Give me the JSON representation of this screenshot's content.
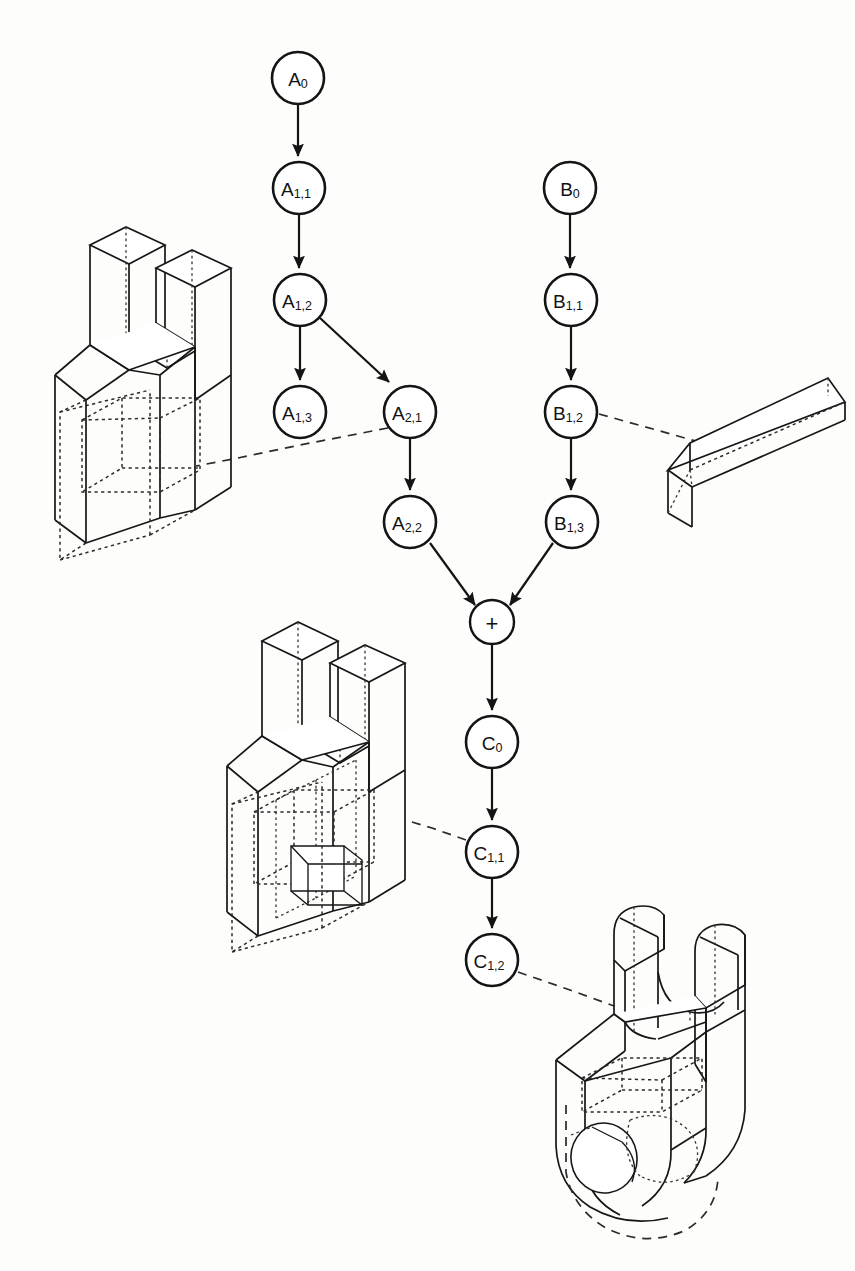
{
  "figure": {
    "kind": "csg-construction-tree",
    "background_color": "#fdfdfc",
    "ink_color": "#141414",
    "width": 855,
    "height": 1271
  },
  "graph": {
    "operator_node": {
      "id": "plus",
      "label": "+",
      "cx": 492,
      "cy": 622,
      "r": 22
    },
    "branches": [
      {
        "name": "A",
        "nodes": [
          {
            "id": "A0",
            "base": "A",
            "sub": "0",
            "cx": 298,
            "cy": 78,
            "r": 26
          },
          {
            "id": "A11",
            "base": "A",
            "sub": "1,1",
            "cx": 299,
            "cy": 188,
            "r": 26
          },
          {
            "id": "A12",
            "base": "A",
            "sub": "1,2",
            "cx": 300,
            "cy": 300,
            "r": 26
          },
          {
            "id": "A13",
            "base": "A",
            "sub": "1,3",
            "cx": 300,
            "cy": 412,
            "r": 26
          },
          {
            "id": "A21",
            "base": "A",
            "sub": "2,1",
            "cx": 410,
            "cy": 412,
            "r": 26
          },
          {
            "id": "A22",
            "base": "A",
            "sub": "2,2",
            "cx": 410,
            "cy": 522,
            "r": 26
          }
        ]
      },
      {
        "name": "B",
        "nodes": [
          {
            "id": "B0",
            "base": "B",
            "sub": "0",
            "cx": 570,
            "cy": 188,
            "r": 26
          },
          {
            "id": "B11",
            "base": "B",
            "sub": "1,1",
            "cx": 571,
            "cy": 300,
            "r": 26
          },
          {
            "id": "B12",
            "base": "B",
            "sub": "1,2",
            "cx": 571,
            "cy": 412,
            "r": 26
          },
          {
            "id": "B13",
            "base": "B",
            "sub": "1,3",
            "cx": 572,
            "cy": 522,
            "r": 26
          }
        ]
      },
      {
        "name": "C",
        "nodes": [
          {
            "id": "C0",
            "base": "C",
            "sub": "0",
            "cx": 492,
            "cy": 742,
            "r": 26
          },
          {
            "id": "C11",
            "base": "C",
            "sub": "1,1",
            "cx": 492,
            "cy": 852,
            "r": 26
          },
          {
            "id": "C12",
            "base": "C",
            "sub": "1,2",
            "cx": 492,
            "cy": 960,
            "r": 26
          }
        ]
      }
    ],
    "edges": [
      {
        "from": "A0",
        "to": "A11",
        "kind": "arrow"
      },
      {
        "from": "A11",
        "to": "A12",
        "kind": "arrow"
      },
      {
        "from": "A12",
        "to": "A13",
        "kind": "arrow"
      },
      {
        "from": "A12",
        "to": "A21",
        "kind": "arrow"
      },
      {
        "from": "A21",
        "to": "A22",
        "kind": "arrow"
      },
      {
        "from": "A22",
        "to": "plus",
        "kind": "arrow"
      },
      {
        "from": "B0",
        "to": "B11",
        "kind": "arrow"
      },
      {
        "from": "B11",
        "to": "B12",
        "kind": "arrow"
      },
      {
        "from": "B12",
        "to": "B13",
        "kind": "arrow"
      },
      {
        "from": "B13",
        "to": "plus",
        "kind": "arrow"
      },
      {
        "from": "plus",
        "to": "C0",
        "kind": "arrow"
      },
      {
        "from": "C0",
        "to": "C11",
        "kind": "arrow"
      },
      {
        "from": "C11",
        "to": "C12",
        "kind": "arrow"
      }
    ],
    "leaders": [
      {
        "id": "leader-a21",
        "from_node": "A21",
        "to_part": "part-u-bracket",
        "points": "388,428 300,445 238,458 196,466"
      },
      {
        "id": "leader-b12",
        "from_node": "B12",
        "to_part": "part-rect-bar",
        "points": "599,414 660,431 706,444"
      },
      {
        "id": "leader-c11",
        "from_node": "C11",
        "to_part": "part-bracket-with-slot",
        "points": "466,840 432,828 405,820"
      },
      {
        "id": "leader-c12",
        "from_node": "C12",
        "to_part": "part-rounded-clevis",
        "points": "518,972 570,990 614,1006"
      }
    ]
  },
  "parts": [
    {
      "id": "part-u-bracket",
      "name": "u-bracket-with-rectangular-through-hole",
      "linked_node": "A2,1"
    },
    {
      "id": "part-rect-bar",
      "name": "rectangular-bar-stock",
      "linked_node": "B1,2"
    },
    {
      "id": "part-bracket-with-slot",
      "name": "u-bracket-with-slot-and-through-hole",
      "linked_node": "C1,1"
    },
    {
      "id": "part-rounded-clevis",
      "name": "rounded-clevis-with-circular-bore",
      "linked_node": "C1,2"
    }
  ]
}
